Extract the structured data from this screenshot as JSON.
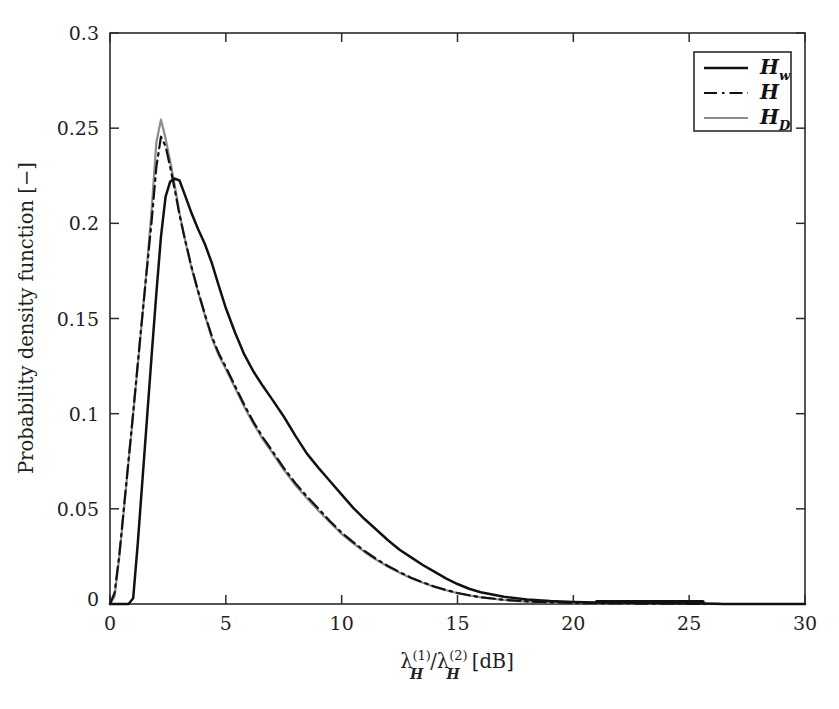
{
  "chart_data": {
    "type": "line",
    "title": "",
    "xlabel": "λ_H^(1)/λ_H^(2) [dB]",
    "xlabel_parts": {
      "lambda": "λ",
      "sup1": "(1)",
      "sub1": "H",
      "slash": "/",
      "sup2": "(2)",
      "sub2": "H",
      "units": "[dB]"
    },
    "ylabel": "Probability density function [−]",
    "xlim": [
      0,
      30
    ],
    "ylim": [
      0,
      0.3
    ],
    "xticks": [
      0,
      5,
      10,
      15,
      20,
      25,
      30
    ],
    "xtick_labels": [
      "0",
      "5",
      "10",
      "15",
      "20",
      "25",
      "30"
    ],
    "yticks": [
      0,
      0.05,
      0.1,
      0.15,
      0.2,
      0.25,
      0.3
    ],
    "ytick_labels": [
      "0",
      "0.05",
      "0.1",
      "0.15",
      "0.2",
      "0.25",
      "0.3"
    ],
    "grid": false,
    "frame": "box",
    "tick_direction": "in",
    "legend_position": "top-right",
    "legend_entries": [
      {
        "label": "H",
        "sub": "w",
        "style": "solid",
        "color": "#111111",
        "width": 2.4
      },
      {
        "label": "H",
        "sub": "",
        "style": "dashdot",
        "color": "#111111",
        "width": 2.2
      },
      {
        "label": "H",
        "sub": "D",
        "style": "solid",
        "color": "#8c8c8c",
        "width": 2.2
      }
    ],
    "x": [
      0.0,
      0.2,
      0.4,
      0.6,
      0.8,
      1.0,
      1.2,
      1.4,
      1.6,
      1.8,
      2.0,
      2.2,
      2.4,
      2.6,
      2.8,
      3.0,
      3.2,
      3.5,
      3.8,
      4.1,
      4.4,
      4.7,
      5.0,
      5.4,
      5.8,
      6.2,
      6.6,
      7.0,
      7.5,
      8.0,
      8.5,
      9.0,
      9.5,
      10.0,
      10.5,
      11.0,
      11.5,
      12.0,
      12.5,
      13.0,
      13.5,
      14.0,
      14.5,
      15.0,
      15.5,
      16.0,
      17.0,
      18.0,
      19.0,
      20.0,
      21.0,
      22.0,
      23.0,
      24.0,
      25.0,
      25.6,
      26.5,
      28.0,
      30.0
    ],
    "series": [
      {
        "name": "H_w",
        "label": "Hw",
        "style": "solid",
        "color": "#111111",
        "values": [
          0.0,
          0.0,
          0.0,
          0.0,
          0.0,
          0.003,
          0.032,
          0.065,
          0.098,
          0.131,
          0.163,
          0.193,
          0.214,
          0.222,
          0.2235,
          0.2225,
          0.216,
          0.206,
          0.197,
          0.189,
          0.179,
          0.167,
          0.1555,
          0.1425,
          0.131,
          0.122,
          0.1145,
          0.1075,
          0.0985,
          0.0885,
          0.079,
          0.0715,
          0.0645,
          0.0575,
          0.0505,
          0.0445,
          0.039,
          0.0335,
          0.0285,
          0.0245,
          0.0205,
          0.017,
          0.0135,
          0.0105,
          0.008,
          0.0062,
          0.0038,
          0.0024,
          0.0016,
          0.0011,
          0.0008,
          0.0006,
          0.0005,
          0.0004,
          0.0003,
          0.0002,
          0.0,
          0.0,
          0.0
        ]
      },
      {
        "name": "H",
        "label": "H",
        "style": "dashdot",
        "color": "#111111",
        "values": [
          0.0,
          0.006,
          0.0255,
          0.0505,
          0.0755,
          0.1005,
          0.1265,
          0.152,
          0.177,
          0.2015,
          0.2295,
          0.2455,
          0.2405,
          0.2295,
          0.2175,
          0.2045,
          0.1935,
          0.178,
          0.1645,
          0.152,
          0.1405,
          0.1315,
          0.1245,
          0.1145,
          0.1045,
          0.0955,
          0.0875,
          0.0805,
          0.0715,
          0.0635,
          0.0565,
          0.05,
          0.0435,
          0.0375,
          0.0325,
          0.0278,
          0.0236,
          0.02,
          0.0168,
          0.0138,
          0.0114,
          0.0092,
          0.0074,
          0.0058,
          0.0046,
          0.0036,
          0.0022,
          0.0014,
          0.0009,
          0.0006,
          0.0004,
          0.0003,
          0.0002,
          0.0002,
          0.0001,
          0.0001,
          0.0,
          0.0,
          0.0
        ]
      },
      {
        "name": "H_D",
        "label": "HD",
        "style": "solid",
        "color": "#8c8c8c",
        "values": [
          0.0,
          0.004,
          0.0245,
          0.0495,
          0.0745,
          0.0995,
          0.1255,
          0.1515,
          0.178,
          0.2075,
          0.2425,
          0.2545,
          0.2445,
          0.2325,
          0.2195,
          0.2055,
          0.1935,
          0.1775,
          0.164,
          0.1515,
          0.1395,
          0.1305,
          0.1235,
          0.1135,
          0.1035,
          0.0945,
          0.0865,
          0.0795,
          0.0705,
          0.0625,
          0.0555,
          0.049,
          0.0428,
          0.0368,
          0.0318,
          0.0272,
          0.0232,
          0.0196,
          0.0164,
          0.0135,
          0.0112,
          0.009,
          0.0072,
          0.0057,
          0.0045,
          0.0035,
          0.0021,
          0.0013,
          0.0009,
          0.0006,
          0.0004,
          0.0003,
          0.0002,
          0.0001,
          0.0001,
          0.0,
          0.0,
          0.0,
          0.0
        ]
      }
    ],
    "annotations": [],
    "colors": {
      "black": "#111111",
      "gray": "#8c8c8c",
      "axis": "#2b2b2b",
      "background": "#ffffff"
    }
  }
}
